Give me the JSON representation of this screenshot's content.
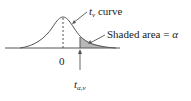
{
  "diagram": {
    "curve_label_symbol": "t",
    "curve_label_sub": "ν",
    "curve_label_text": " curve",
    "shaded_label": "Shaded area = ",
    "shaded_symbol": "α",
    "zero_label": "0",
    "critical_symbol": "t",
    "critical_sub": "α,ν",
    "colors": {
      "line": "#555555",
      "shade": "#b8b8b8",
      "background": "#ffffff"
    }
  }
}
